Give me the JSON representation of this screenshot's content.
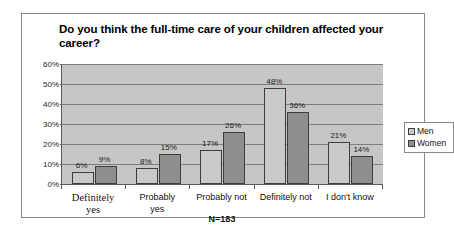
{
  "chart_data": {
    "type": "bar",
    "title": "Do you think the full-time care of your children affected your career?",
    "xlabel": "",
    "ylabel": "",
    "ylim": [
      0,
      60
    ],
    "ytick_labels": [
      "0%",
      "10%",
      "20%",
      "30%",
      "40%",
      "50%",
      "60%"
    ],
    "ytick_values": [
      0,
      10,
      20,
      30,
      40,
      50,
      60
    ],
    "grid": true,
    "legend_position": "right",
    "annotation": "N=183",
    "categories": [
      "Definitely\nyes",
      "Probably\nyes",
      "Probably not",
      "Definitely not",
      "I don't know"
    ],
    "series": [
      {
        "name": "Men",
        "color": "#c9c9c9",
        "values": [
          6,
          8,
          17,
          48,
          21
        ],
        "labels": [
          "6%",
          "8%",
          "17%",
          "48%",
          "21%"
        ]
      },
      {
        "name": "Women",
        "color": "#8e8e8e",
        "values": [
          9,
          15,
          26,
          36,
          14
        ],
        "labels": [
          "9%",
          "15%",
          "26%",
          "36%",
          "14%"
        ]
      }
    ]
  }
}
